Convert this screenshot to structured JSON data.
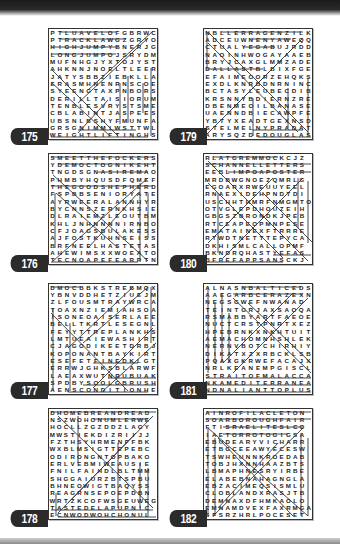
{
  "page": {
    "puzzles": [
      {
        "number": "175",
        "rows": [
          "PTLUAVELOFGBRWC",
          "PTRACKLAWGZGRYO",
          "HIGHJUMPYBNERJG",
          "LONGJUMPOJSRYDM",
          "MUFNHGJYXTOJYST",
          "AHKNNJNOELTLEER",
          "JATYSBBZIEBKLLA",
          "ERASMHNENRNSCOE",
          "SYEENGTAXPNBORS",
          "DERILLTAISIORUM",
          "TENBLESVRYSTSME",
          "CBLABINTJASPEES",
          "UBSNLBSHYFMUNFA",
          "GRSGNIMMIWSTTWL",
          "WEIGHTLIFTINGHS"
        ]
      },
      {
        "number": "176",
        "rows": [
          "SMEETTHEFOCKERS",
          "YDEMOCTOGNIKEHT",
          "TNGDSGNASIREMAO",
          "PHMBYHQUSDFQMEF",
          "THEGOODSHEPHERD",
          "FSPBBSENIORYATE",
          "AYRWEERALANNHYR",
          "BYCNNSZERNKHSIE",
          "DLRAIEMZLEOUTBM",
          "KHLJNHNNNNIRNBO",
          "CFJOAGSBULAKESS",
          "AJFOSTKUHNSEISS",
          "BRFNEELHASTETAS",
          "AHEWIMSXXWOEATO",
          "TECNOAPEFEARRTN"
        ]
      },
      {
        "number": "177",
        "rows": [
          "DMOCBBKSTREBMQX",
          "YBNVDDHETZIUEJM",
          "ZLFOUSMTRAYWRCA",
          "TOAXNZIEMIAHSOA",
          "ISONEOAISERLAEE",
          "BELLTKRTLESEGNL",
          "FEYYTTREPLANKHS",
          "LMTUEAIEWASHIRT",
          "CJAGODIKEETDRBJ",
          "KOPONANTBAYKIRT",
          "ESEFETFINEDKLGT",
          "ERRWJGHKSBLARWF",
          "LAEAXWUTNRUBUAK",
          "SPDBYSOOLGBRUSH",
          "AENSCONDITIONHE"
        ]
      },
      {
        "number": "178",
        "rows": [
          "DHOMEBREANDREAD",
          "NSZWOHONUMLERWE",
          "HOCLLZGZDDZLAGY",
          "MWSTIEKDIZRIIJJ",
          "FZTHSYHRMENFFBK",
          "WXBLMSIGTTEPEBC",
          "ODIRONGNTOPBAKO",
          "ERLVEBMIWEAUSIE",
          "FNILFAIHDLBLTMM",
          "SHGGAIURZBTSPBU",
          "BHNEOWIGTBAQYSS",
          "REAGRNSEPOEPDBN",
          "WRTZKCOFWSGEUWEG",
          "TASTEDELAPUPNIC",
          "ECNWODWOHCHONUL"
        ]
      },
      {
        "number": "179",
        "rows": [
          "NBLLERRAGENZILK",
          "ADCEUWNENYAWEQQ",
          "CTUALYEGABUJRDD",
          "NAOINHWOGAYAAEB",
          "BRYJCAXGLMMZADE",
          "DALLASTBLBIXFGE",
          "EFAIMEOORZEHQKS",
          "EXDLKNRBDNRNINC",
          "BCTASYLEUBECDIB",
          "KRSNNYBDIERNZRE",
          "DBENMEOILBANASE",
          "UAENNDBIECAWPFE",
          "YBTYXEADTGEXNSD",
          "STELMELNYPRADAT",
          "ARYSQZDEDOUGLAS"
        ]
      },
      {
        "number": "180",
        "rows": [
          "RLATGREMMOCKCJZ",
          "SCHANNELLETTERS",
          "EEBLIMPOAPOSTER",
          "MRDBWGNOEZQMRLG",
          "EGOARXRWEUUYEEL",
          "RNAEXIDEHPNDTDI",
          "USCHHTHMRFNMGMTO",
          "OTVGLEPDHOUZEIH",
          "GBGSZBRONDKJPEB",
          "RTCEAPEOPMNPESE",
          "EMATAINEXFTRRRE",
          "RTWDTNETTTEPYCA",
          "DKHISMLCALLOPMF",
          "BKNDRQHASTYEFAS",
          "BFREFAPPSANSCKJ"
        ]
      },
      {
        "number": "181",
        "rows": [
          "ALNASNBALTICEDS",
          "AAEGARBCERAZEXN",
          "NEGSGWEFNWANAD",
          "TEINTGRJAXSAOQA",
          "RSMABBYARTFAEOE",
          "NUCTCRSTPNRTXEZ",
          "HPEBRNKXNKHTUIT",
          "AEMACHOMNHSHLEK",
          "NERNVBOTCHIRHIY",
          "DIKATXZXRBCKLSB",
          "PQAXGKRWEFACAJX",
          "NRLKEANEMPGISCL",
          "STRAITOFMALACCA",
          "NKAMEDITERRANEA",
          "NDNALIANTTOPLUS"
        ]
      },
      {
        "number": "182",
        "rows": [
          "AINROFILACLETON",
          "SOARBOROUGHFAIR",
          "FTISRAELITESLCO",
          "IAETORROTOGIGSA",
          "EBUDEARYVICHARR",
          "ETBGCEEAWYECESW",
          "TSWHEUNNKROEDAB",
          "TOBJHXNNHAAZBTS",
          "LBMAPHNESRYIRBE",
          "ELABEBNAHAGNGLA",
          "EBZACIMEQSISMLU",
          "CLOBLANDXRASJTB",
          "DEMNAXDFHMKAOLO",
          "EMNAMDVEXFAXRMGA",
          "SFSRZHRLPOCESET"
        ]
      }
    ]
  }
}
